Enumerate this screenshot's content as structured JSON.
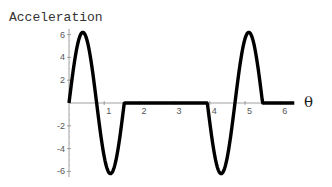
{
  "chart_data": {
    "type": "line",
    "title": "Acceleration",
    "xlabel": "θ",
    "ylabel": "",
    "xlim": [
      0,
      6.4
    ],
    "ylim": [
      -6.5,
      6.5
    ],
    "x_ticks": [
      1,
      2,
      3,
      4,
      5,
      6
    ],
    "y_ticks": [
      6,
      4,
      2,
      -2,
      -4,
      -6
    ],
    "grid": false,
    "legend": null,
    "series": [
      {
        "name": "Acceleration",
        "description": "piecewise: sinusoidal full cycle on [0,1.57] (peak +6.2 at ~0.39, min -6.2 at ~1.18), zero on [1.57,3.93], inverted sinusoidal cycle on [3.93,5.5] (min -6.2 at ~4.32, peak +6.2 at ~5.11), zero on [5.5,6.4]",
        "x": [
          0,
          0.2,
          0.39,
          0.6,
          0.785,
          1.0,
          1.18,
          1.4,
          1.57,
          2.0,
          3.0,
          3.93,
          4.13,
          4.32,
          4.5,
          4.71,
          4.9,
          5.11,
          5.3,
          5.5,
          6.0,
          6.4
        ],
        "y": [
          0,
          4.4,
          6.2,
          4.3,
          0,
          -4.6,
          -6.2,
          -4.0,
          0,
          0,
          0,
          0,
          -4.4,
          -6.2,
          -4.6,
          0,
          4.3,
          6.2,
          4.4,
          0,
          0,
          0
        ]
      }
    ]
  }
}
